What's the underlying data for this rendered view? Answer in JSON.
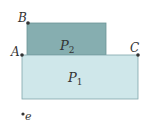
{
  "diagram": {
    "colors": {
      "p1_fill": "#cfe7ea",
      "p1_stroke": "#7fa6ab",
      "p2_fill": "#86aeb0",
      "p2_stroke": "#6b9597",
      "point": "#333333"
    },
    "regions": [
      {
        "id": "P1",
        "label": "P",
        "subscript": "1",
        "x": 22,
        "y": 55,
        "w": 116,
        "h": 44
      },
      {
        "id": "P2",
        "label": "P",
        "subscript": "2",
        "x": 27,
        "y": 23,
        "w": 79,
        "h": 32
      }
    ],
    "points": [
      {
        "name": "A",
        "label": "A",
        "x": 22,
        "y": 55
      },
      {
        "name": "B",
        "label": "B",
        "x": 28,
        "y": 23
      },
      {
        "name": "C",
        "label": "C",
        "x": 138,
        "y": 55
      },
      {
        "name": "e",
        "label": "e",
        "x": 23,
        "y": 114
      }
    ]
  }
}
